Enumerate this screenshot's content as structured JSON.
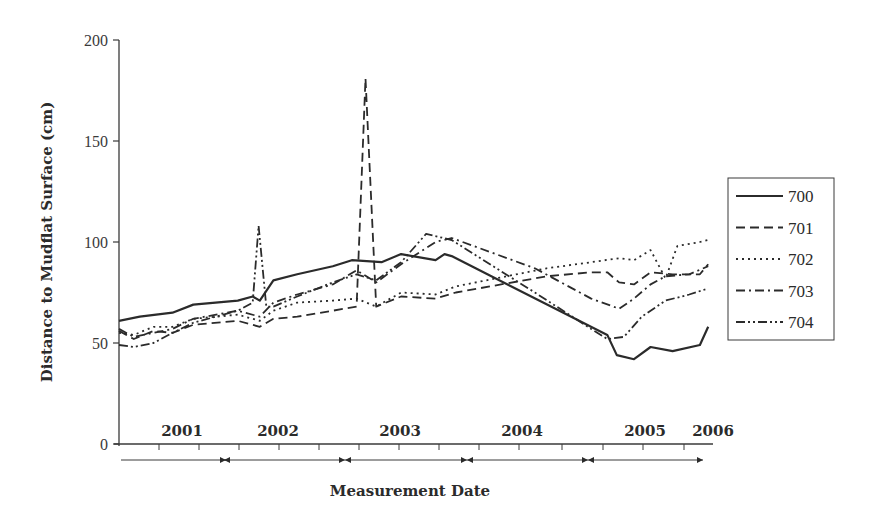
{
  "chart_data": {
    "type": "line",
    "title": "",
    "xlabel": "Measurement Date",
    "ylabel": "Distance to Mudflat Surface (cm)",
    "ylim": [
      0,
      200
    ],
    "yticks": [
      0,
      50,
      100,
      150,
      200
    ],
    "grid": false,
    "legend_position": "right",
    "x_year_labels": [
      {
        "label": "2001",
        "x": 0.12
      },
      {
        "label": "2002",
        "x": 0.27
      },
      {
        "label": "2003",
        "x": 0.47
      },
      {
        "label": "2004",
        "x": 0.67
      },
      {
        "label": "2005",
        "x": 0.87
      },
      {
        "label": "2006",
        "x": 0.99
      }
    ],
    "x_note": "x values are approximate fractions of the measurement period (Jan 2001 – early 2006)",
    "series": [
      {
        "name": "700",
        "style": "solid",
        "points": [
          [
            0.0,
            61
          ],
          [
            0.035,
            63
          ],
          [
            0.09,
            65
          ],
          [
            0.125,
            69
          ],
          [
            0.2,
            71
          ],
          [
            0.225,
            73
          ],
          [
            0.237,
            71
          ],
          [
            0.26,
            81
          ],
          [
            0.3,
            84
          ],
          [
            0.36,
            88
          ],
          [
            0.392,
            91
          ],
          [
            0.442,
            90
          ],
          [
            0.475,
            94
          ],
          [
            0.533,
            91
          ],
          [
            0.548,
            94
          ],
          [
            0.56,
            93
          ],
          [
            0.822,
            54
          ],
          [
            0.838,
            44
          ],
          [
            0.867,
            42
          ],
          [
            0.895,
            48
          ],
          [
            0.932,
            46
          ],
          [
            0.978,
            49
          ],
          [
            0.992,
            58
          ]
        ]
      },
      {
        "name": "701",
        "style": "dashed",
        "points": [
          [
            0.0,
            56
          ],
          [
            0.025,
            52
          ],
          [
            0.058,
            56
          ],
          [
            0.09,
            55
          ],
          [
            0.125,
            59
          ],
          [
            0.2,
            61
          ],
          [
            0.237,
            58
          ],
          [
            0.26,
            62
          ],
          [
            0.3,
            63
          ],
          [
            0.36,
            66
          ],
          [
            0.4,
            68
          ],
          [
            0.415,
            181
          ],
          [
            0.433,
            68
          ],
          [
            0.475,
            73
          ],
          [
            0.533,
            72
          ],
          [
            0.567,
            75
          ],
          [
            0.72,
            83
          ],
          [
            0.795,
            85
          ],
          [
            0.822,
            85
          ],
          [
            0.842,
            80
          ],
          [
            0.867,
            79
          ],
          [
            0.895,
            85
          ],
          [
            0.932,
            84
          ],
          [
            0.978,
            84
          ],
          [
            0.992,
            89
          ]
        ]
      },
      {
        "name": "702",
        "style": "dotted",
        "points": [
          [
            0.0,
            55
          ],
          [
            0.025,
            54
          ],
          [
            0.058,
            58
          ],
          [
            0.09,
            58
          ],
          [
            0.125,
            62
          ],
          [
            0.2,
            64
          ],
          [
            0.237,
            61
          ],
          [
            0.26,
            66
          ],
          [
            0.3,
            70
          ],
          [
            0.36,
            71
          ],
          [
            0.4,
            72
          ],
          [
            0.433,
            68
          ],
          [
            0.475,
            75
          ],
          [
            0.533,
            74
          ],
          [
            0.567,
            78
          ],
          [
            0.72,
            87
          ],
          [
            0.795,
            90
          ],
          [
            0.842,
            92
          ],
          [
            0.867,
            91
          ],
          [
            0.895,
            96
          ],
          [
            0.92,
            82
          ],
          [
            0.94,
            98
          ],
          [
            0.978,
            100
          ],
          [
            0.992,
            101
          ]
        ]
      },
      {
        "name": "703",
        "style": "dash-dot",
        "points": [
          [
            0.0,
            57
          ],
          [
            0.025,
            53
          ],
          [
            0.058,
            55
          ],
          [
            0.09,
            57
          ],
          [
            0.125,
            62
          ],
          [
            0.2,
            66
          ],
          [
            0.237,
            63
          ],
          [
            0.26,
            70
          ],
          [
            0.3,
            74
          ],
          [
            0.36,
            79
          ],
          [
            0.4,
            86
          ],
          [
            0.433,
            80
          ],
          [
            0.475,
            89
          ],
          [
            0.533,
            100
          ],
          [
            0.56,
            102
          ],
          [
            0.7,
            87
          ],
          [
            0.795,
            72
          ],
          [
            0.842,
            67
          ],
          [
            0.867,
            72
          ],
          [
            0.895,
            79
          ],
          [
            0.92,
            83
          ],
          [
            0.96,
            84
          ],
          [
            0.992,
            88
          ]
        ]
      },
      {
        "name": "704",
        "style": "dash-dot-dot",
        "points": [
          [
            0.0,
            49
          ],
          [
            0.025,
            48
          ],
          [
            0.058,
            50
          ],
          [
            0.09,
            55
          ],
          [
            0.125,
            60
          ],
          [
            0.2,
            66
          ],
          [
            0.225,
            70
          ],
          [
            0.235,
            108
          ],
          [
            0.248,
            68
          ],
          [
            0.26,
            68
          ],
          [
            0.3,
            73
          ],
          [
            0.36,
            80
          ],
          [
            0.4,
            84
          ],
          [
            0.433,
            81
          ],
          [
            0.475,
            90
          ],
          [
            0.517,
            104
          ],
          [
            0.56,
            101
          ],
          [
            0.7,
            75
          ],
          [
            0.795,
            57
          ],
          [
            0.822,
            52
          ],
          [
            0.85,
            53
          ],
          [
            0.88,
            63
          ],
          [
            0.92,
            71
          ],
          [
            0.96,
            74
          ],
          [
            0.992,
            77
          ]
        ]
      }
    ]
  },
  "axes": {
    "ylabel": "Distance to Mudflat Surface (cm)",
    "xlabel": "Measurement Date",
    "ytick_labels": [
      "0",
      "50",
      "100",
      "150",
      "200"
    ],
    "year_labels": [
      "2001",
      "2002",
      "2003",
      "2004",
      "2005",
      "2006"
    ]
  },
  "legend": {
    "items": [
      {
        "label": "700",
        "style": "solid"
      },
      {
        "label": "701",
        "style": "dashed"
      },
      {
        "label": "702",
        "style": "dotted"
      },
      {
        "label": "703",
        "style": "dash-dot"
      },
      {
        "label": "704",
        "style": "dash-dot-dot"
      }
    ]
  },
  "colors": {
    "line": "#2b2b2b",
    "axis": "#3a3a3a",
    "background": "#ffffff"
  }
}
